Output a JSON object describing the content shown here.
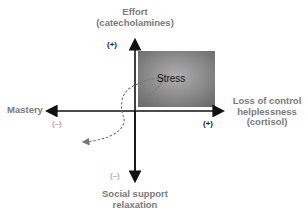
{
  "diagram": {
    "axes": {
      "top": {
        "label_line1": "Effort",
        "label_line2": "(catecholamines)",
        "sign": "(+)"
      },
      "bottom": {
        "label_line1": "Social support",
        "label_line2": "relaxation",
        "sign": "(–)"
      },
      "left": {
        "label": "Mastery",
        "sign": "(–)"
      },
      "right": {
        "label_line1": "Loss of control",
        "label_line2": "helplessness",
        "label_line3": "(cortisol)",
        "sign": "(+)"
      }
    },
    "quadrant_box": {
      "label": "Stress",
      "fill_center": "#a8a8a8",
      "fill_edge": "#6e6e6e"
    },
    "curve": {
      "style": "dashed",
      "color": "#777777",
      "direction": "from stress to lower-left quadrant"
    },
    "colors": {
      "axis": "#111111",
      "label_text": "#7a7a7a"
    }
  }
}
